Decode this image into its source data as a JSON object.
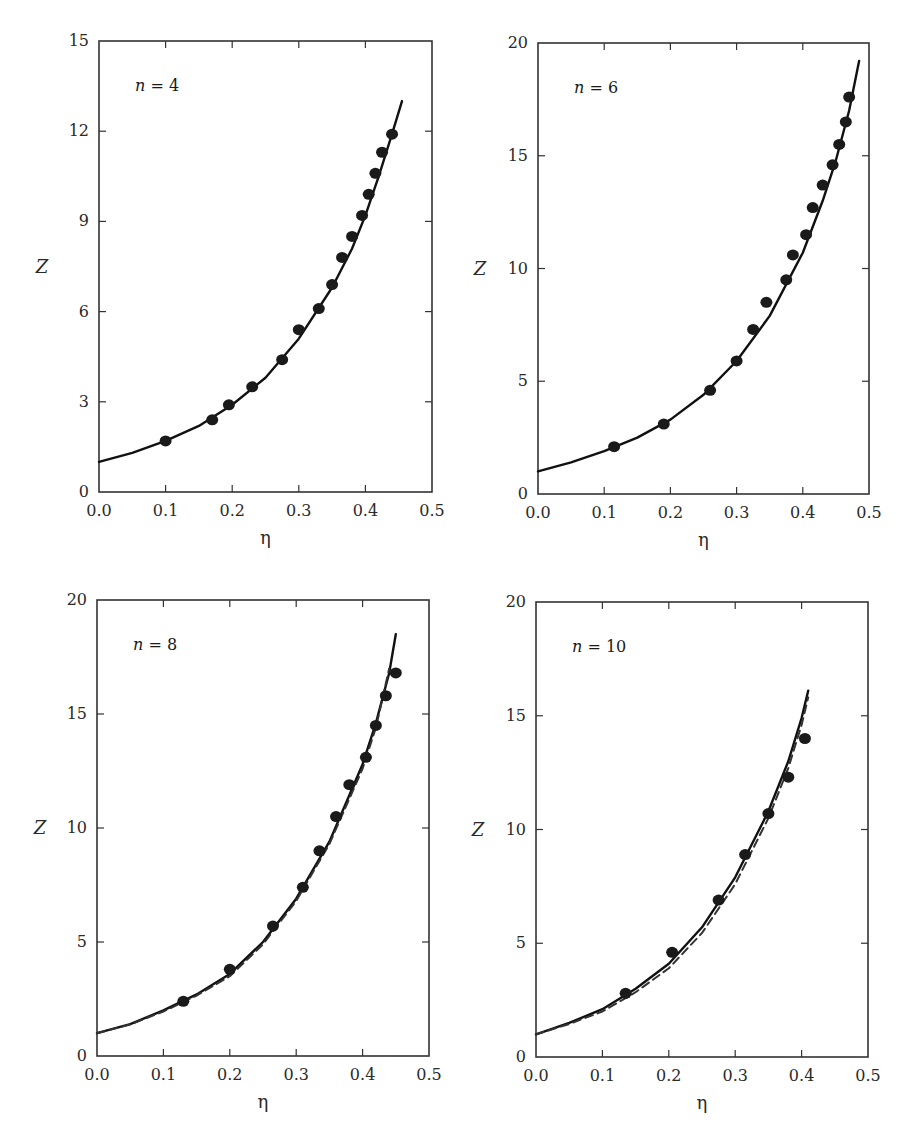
{
  "chart_data": [
    {
      "type": "scatter",
      "panel_label": "n = 4",
      "n": 4,
      "xlabel": "η",
      "ylabel": "Z",
      "xlim": [
        0.0,
        0.5
      ],
      "ylim": [
        0,
        15
      ],
      "xticks": [
        "0.0",
        "0.1",
        "0.2",
        "0.3",
        "0.4",
        "0.5"
      ],
      "yticks": [
        "0",
        "3",
        "6",
        "9",
        "12",
        "15"
      ],
      "ytick_values": [
        0,
        3,
        6,
        9,
        12,
        15
      ],
      "grid": false,
      "series": [
        {
          "name": "theory (solid)",
          "style": "solid",
          "x": [
            0.0,
            0.05,
            0.1,
            0.15,
            0.2,
            0.25,
            0.3,
            0.35,
            0.38,
            0.4,
            0.42,
            0.44,
            0.455
          ],
          "y": [
            1.0,
            1.3,
            1.7,
            2.2,
            2.9,
            3.8,
            5.1,
            6.8,
            8.1,
            9.2,
            10.5,
            11.9,
            13.0
          ]
        },
        {
          "name": "simulation (points)",
          "style": "points",
          "x": [
            0.1,
            0.17,
            0.195,
            0.23,
            0.275,
            0.3,
            0.33,
            0.35,
            0.365,
            0.38,
            0.395,
            0.405,
            0.415,
            0.425,
            0.44
          ],
          "y": [
            1.7,
            2.4,
            2.9,
            3.5,
            4.4,
            5.4,
            6.1,
            6.9,
            7.8,
            8.5,
            9.2,
            9.9,
            10.6,
            11.3,
            11.9
          ]
        }
      ]
    },
    {
      "type": "scatter",
      "panel_label": "n = 6",
      "n": 6,
      "xlabel": "η",
      "ylabel": "Z",
      "xlim": [
        0.0,
        0.5
      ],
      "ylim": [
        0,
        20
      ],
      "xticks": [
        "0.0",
        "0.1",
        "0.2",
        "0.3",
        "0.4",
        "0.5"
      ],
      "yticks": [
        "0",
        "5",
        "10",
        "15",
        "20"
      ],
      "ytick_values": [
        0,
        5,
        10,
        15,
        20
      ],
      "grid": false,
      "series": [
        {
          "name": "theory (solid)",
          "style": "solid",
          "x": [
            0.0,
            0.05,
            0.1,
            0.15,
            0.2,
            0.25,
            0.3,
            0.35,
            0.4,
            0.43,
            0.45,
            0.47,
            0.485
          ],
          "y": [
            1.0,
            1.4,
            1.9,
            2.5,
            3.3,
            4.4,
            5.9,
            7.9,
            10.7,
            13.0,
            14.8,
            17.0,
            19.2
          ]
        },
        {
          "name": "simulation (points)",
          "style": "points",
          "x": [
            0.115,
            0.19,
            0.26,
            0.3,
            0.325,
            0.345,
            0.375,
            0.385,
            0.405,
            0.415,
            0.43,
            0.445,
            0.455,
            0.465,
            0.47
          ],
          "y": [
            2.1,
            3.1,
            4.6,
            5.9,
            7.3,
            8.5,
            9.5,
            10.6,
            11.5,
            12.7,
            13.7,
            14.6,
            15.5,
            16.5,
            17.6
          ]
        }
      ]
    },
    {
      "type": "scatter",
      "panel_label": "n = 8",
      "n": 8,
      "xlabel": "η",
      "ylabel": "Z",
      "xlim": [
        0.0,
        0.5
      ],
      "ylim": [
        0,
        20
      ],
      "xticks": [
        "0.0",
        "0.1",
        "0.2",
        "0.3",
        "0.4",
        "0.5"
      ],
      "yticks": [
        "0",
        "5",
        "10",
        "15",
        "20"
      ],
      "ytick_values": [
        0,
        5,
        10,
        15,
        20
      ],
      "grid": false,
      "series": [
        {
          "name": "theory (solid)",
          "style": "solid",
          "x": [
            0.0,
            0.05,
            0.1,
            0.15,
            0.2,
            0.25,
            0.3,
            0.35,
            0.4,
            0.42,
            0.44,
            0.45
          ],
          "y": [
            1.0,
            1.4,
            2.0,
            2.7,
            3.6,
            5.0,
            6.9,
            9.4,
            12.8,
            14.6,
            16.8,
            18.5
          ]
        },
        {
          "name": "theory (dashed)",
          "style": "dashed",
          "x": [
            0.0,
            0.05,
            0.1,
            0.15,
            0.2,
            0.25,
            0.3,
            0.35,
            0.4,
            0.42,
            0.44
          ],
          "y": [
            1.0,
            1.38,
            1.95,
            2.65,
            3.5,
            4.9,
            6.8,
            9.3,
            12.6,
            14.4,
            17.0
          ]
        },
        {
          "name": "simulation (points)",
          "style": "points",
          "x": [
            0.13,
            0.2,
            0.265,
            0.31,
            0.335,
            0.36,
            0.38,
            0.405,
            0.42,
            0.435,
            0.45
          ],
          "y": [
            2.4,
            3.8,
            5.7,
            7.4,
            9.0,
            10.5,
            11.9,
            13.1,
            14.5,
            15.8,
            16.8
          ]
        }
      ]
    },
    {
      "type": "scatter",
      "panel_label": "n = 10",
      "n": 10,
      "xlabel": "η",
      "ylabel": "Z",
      "xlim": [
        0.0,
        0.5
      ],
      "ylim": [
        0,
        20
      ],
      "xticks": [
        "0.0",
        "0.1",
        "0.2",
        "0.3",
        "0.4",
        "0.5"
      ],
      "yticks": [
        "0",
        "5",
        "10",
        "15",
        "20"
      ],
      "ytick_values": [
        0,
        5,
        10,
        15,
        20
      ],
      "grid": false,
      "series": [
        {
          "name": "theory (solid)",
          "style": "solid",
          "x": [
            0.0,
            0.05,
            0.1,
            0.15,
            0.2,
            0.25,
            0.3,
            0.35,
            0.38,
            0.4,
            0.41
          ],
          "y": [
            1.0,
            1.5,
            2.1,
            3.0,
            4.1,
            5.7,
            7.9,
            10.8,
            13.0,
            14.9,
            16.1
          ]
        },
        {
          "name": "theory (dashed)",
          "style": "dashed",
          "x": [
            0.0,
            0.05,
            0.1,
            0.15,
            0.2,
            0.25,
            0.3,
            0.35,
            0.38,
            0.4,
            0.41
          ],
          "y": [
            1.0,
            1.45,
            2.0,
            2.85,
            3.9,
            5.45,
            7.6,
            10.5,
            12.7,
            14.6,
            15.8
          ]
        },
        {
          "name": "simulation (points)",
          "style": "points",
          "x": [
            0.135,
            0.205,
            0.275,
            0.315,
            0.35,
            0.38,
            0.405
          ],
          "y": [
            2.8,
            4.6,
            6.9,
            8.9,
            10.7,
            12.3,
            14.0
          ]
        }
      ]
    }
  ],
  "panels_layout": [
    {
      "frame": {
        "x0": 99,
        "y0": 41,
        "x1": 432,
        "y1": 492
      }
    },
    {
      "frame": {
        "x0": 538,
        "y0": 43,
        "x1": 869,
        "y1": 494
      }
    },
    {
      "frame": {
        "x0": 97,
        "y0": 600,
        "x1": 429,
        "y1": 1056
      }
    },
    {
      "frame": {
        "x0": 536,
        "y0": 602,
        "x1": 868,
        "y1": 1057
      }
    }
  ]
}
